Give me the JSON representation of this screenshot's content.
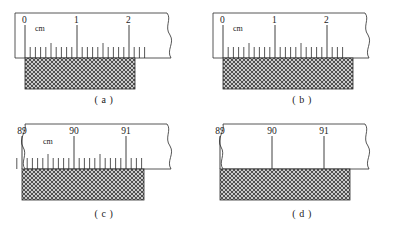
{
  "figure": {
    "background_color": "#ffffff",
    "line_color": "#2b2b2b",
    "hatch_color": "#555555",
    "panel_count": 4
  },
  "panels": [
    {
      "id": "a",
      "caption": "( a )",
      "unit_label": "cm",
      "has_unit_label": true,
      "tick_resolution_mm": 1,
      "has_minor_ticks": true,
      "break_left": false,
      "break_right": true,
      "major_labels": [
        "0",
        "1",
        "2"
      ],
      "major_values": [
        0,
        1,
        2
      ],
      "scale_start": 0,
      "scale_end": 2.35,
      "block_start_cm": 0.0,
      "block_end_cm": 1.7,
      "block_reading": "1.70",
      "block_height_px": 31
    },
    {
      "id": "b",
      "caption": "( b )",
      "unit_label": "cm",
      "has_unit_label": true,
      "tick_resolution_mm": 1,
      "has_minor_ticks": true,
      "break_left": false,
      "break_right": true,
      "major_labels": [
        "0",
        "1",
        "2"
      ],
      "major_values": [
        0,
        1,
        2
      ],
      "scale_start": 0,
      "scale_end": 2.35,
      "block_start_cm": 0.0,
      "block_end_cm": 2.0,
      "block_reading": "2.00",
      "block_height_px": 31
    },
    {
      "id": "c",
      "caption": "( c )",
      "unit_label": "cm",
      "has_unit_label": true,
      "tick_resolution_mm": 1,
      "has_minor_ticks": true,
      "break_left": true,
      "break_right": true,
      "major_labels": [
        "89",
        "90",
        "91"
      ],
      "major_values": [
        89,
        90,
        91
      ],
      "scale_start": 88.78,
      "scale_end": 91.32,
      "block_start_cm": 88.78,
      "block_end_cm": 90.72,
      "block_reading": "90.72",
      "block_height_px": 31
    },
    {
      "id": "d",
      "caption": "( d )",
      "unit_label": "",
      "has_unit_label": false,
      "tick_resolution_mm": 10,
      "has_minor_ticks": false,
      "break_left": true,
      "break_right": true,
      "major_labels": [
        "89",
        "90",
        "91"
      ],
      "major_values": [
        89,
        90,
        91
      ],
      "scale_start": 88.78,
      "scale_end": 91.32,
      "block_start_cm": 88.78,
      "block_end_cm": 90.92,
      "block_reading": "90.9",
      "block_height_px": 31
    }
  ]
}
